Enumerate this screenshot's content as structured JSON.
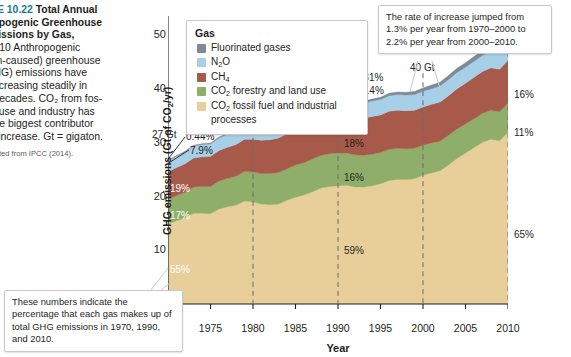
{
  "caption": {
    "figure_number": "URE 10.22",
    "title_line1": "Total Annual",
    "title_line2": "hropogenic Greenhouse",
    "title_line3": "Emissions by Gas,",
    "title_line4": "–2010",
    "body": "Anthropogenic (human-caused) greenhouse gas (GHG) emissions have been increasing steadily in recent decades. CO2 from fossil fuel use and industry has been the biggest contributor to this increase. Gt = gigaton.",
    "body_lines": [
      "–2010   Anthropogenic",
      "man-caused) greenhouse",
      "(GHG) emissions have",
      "n increasing steadily in",
      "nt decades. CO₂ from fos-",
      "uel use and industry has",
      "n the biggest contributor",
      "his increase. Gt = gigaton."
    ],
    "source": "adapted from IPCC (2014)."
  },
  "legend": {
    "title": "Gas",
    "items": [
      {
        "label": "Fluorinated gases",
        "color": "#7e8a99"
      },
      {
        "label": "N₂O",
        "color": "#a8cfe8"
      },
      {
        "label": "CH₄",
        "color": "#a85a4a"
      },
      {
        "label": "CO₂ forestry and land use",
        "color": "#8fae6a"
      },
      {
        "label": "CO₂ fossil fuel and industrial processes",
        "color": "#e8cf9a"
      }
    ]
  },
  "callouts": {
    "rate": "The rate of increase jumped from 1.3% per year from 1970–2000 to 2.2% per year from 2000–2010.",
    "percent": "These numbers indicate the percentage that each gas makes up of total GHG emissions in 1970, 1990, and 2010."
  },
  "annotations": {
    "gt_1970": "27 Gt",
    "gt_1980": "33 Gt",
    "gt_1990": "38 Gt",
    "gt_2000": "40 Gt",
    "gt_2010": "49 Gt",
    "pct_1970": {
      "f_gases": "0.44%",
      "n2o": "7.9%",
      "ch4": "19%",
      "co2_land": "17%",
      "co2_fossil": "55%"
    },
    "pct_1990": {
      "f_gases": "0.81%",
      "n2o": "7.4%",
      "ch4": "18%",
      "co2_land": "16%",
      "co2_fossil": "59%"
    },
    "pct_2010": {
      "f_gases": "2.0%",
      "n2o": "6.2%",
      "ch4": "16%",
      "co2_land": "11%",
      "co2_fossil": "65%"
    }
  },
  "chart_data": {
    "type": "area",
    "xlabel": "Year",
    "ylabel": "GHG emissions (Gt of CO₂/yr)",
    "xlim": [
      1970,
      2010
    ],
    "ylim": [
      -2,
      54
    ],
    "yticks": [
      -2,
      10,
      20,
      30,
      40,
      50
    ],
    "ytick_labels": [
      "–2",
      "10",
      "20",
      "30",
      "40",
      "50"
    ],
    "xticks": [
      1970,
      1975,
      1980,
      1985,
      1990,
      1995,
      2000,
      2005,
      2010
    ],
    "grid": false,
    "legend_position": "top-left-inside",
    "stacked": true,
    "x": [
      1970,
      1971,
      1972,
      1973,
      1974,
      1975,
      1976,
      1977,
      1978,
      1979,
      1980,
      1981,
      1982,
      1983,
      1984,
      1985,
      1986,
      1987,
      1988,
      1989,
      1990,
      1991,
      1992,
      1993,
      1994,
      1995,
      1996,
      1997,
      1998,
      1999,
      2000,
      2001,
      2002,
      2003,
      2004,
      2005,
      2006,
      2007,
      2008,
      2009,
      2010
    ],
    "series": [
      {
        "name": "CO₂ fossil fuel and industrial processes",
        "color": "#e8cf9a",
        "values": [
          14.9,
          15.5,
          16.0,
          16.9,
          16.9,
          16.8,
          17.7,
          18.1,
          18.4,
          19.2,
          19.0,
          18.6,
          18.5,
          18.6,
          19.3,
          19.9,
          20.3,
          20.9,
          21.6,
          21.9,
          22.0,
          22.1,
          21.8,
          21.8,
          22.0,
          22.4,
          23.0,
          23.2,
          23.2,
          23.3,
          24.0,
          24.4,
          24.8,
          25.9,
          27.1,
          28.1,
          29.1,
          30.1,
          30.7,
          30.4,
          32.0
        ]
      },
      {
        "name": "CO₂ forestry and land use",
        "color": "#8fae6a",
        "values": [
          4.6,
          4.7,
          4.8,
          4.9,
          5.0,
          5.1,
          5.2,
          5.3,
          5.4,
          5.5,
          5.6,
          5.7,
          5.8,
          5.9,
          5.9,
          6.0,
          6.0,
          6.1,
          6.1,
          6.1,
          6.1,
          6.0,
          6.0,
          5.9,
          5.9,
          5.8,
          5.8,
          5.8,
          5.7,
          5.7,
          5.6,
          5.6,
          5.5,
          5.5,
          5.5,
          5.4,
          5.4,
          5.4,
          5.4,
          5.4,
          5.4
        ]
      },
      {
        "name": "CH₄",
        "color": "#a85a4a",
        "values": [
          5.1,
          5.2,
          5.3,
          5.4,
          5.5,
          5.6,
          5.7,
          5.8,
          5.9,
          6.0,
          6.1,
          6.2,
          6.3,
          6.4,
          6.5,
          6.6,
          6.7,
          6.8,
          6.9,
          6.9,
          6.9,
          6.9,
          6.9,
          6.9,
          7.0,
          7.0,
          7.1,
          7.1,
          7.1,
          7.1,
          7.1,
          7.2,
          7.3,
          7.4,
          7.5,
          7.6,
          7.7,
          7.8,
          7.9,
          7.9,
          8.0
        ]
      },
      {
        "name": "N₂O",
        "color": "#a8cfe8",
        "values": [
          2.1,
          2.1,
          2.2,
          2.2,
          2.3,
          2.3,
          2.3,
          2.4,
          2.4,
          2.5,
          2.5,
          2.5,
          2.6,
          2.6,
          2.6,
          2.7,
          2.7,
          2.7,
          2.8,
          2.8,
          2.8,
          2.8,
          2.8,
          2.8,
          2.9,
          2.9,
          2.9,
          2.9,
          2.9,
          2.9,
          2.9,
          2.9,
          3.0,
          3.0,
          3.0,
          3.0,
          3.0,
          3.0,
          3.0,
          3.0,
          3.1
        ]
      },
      {
        "name": "Fluorinated gases",
        "color": "#7e8a99",
        "values": [
          0.12,
          0.13,
          0.14,
          0.15,
          0.16,
          0.17,
          0.18,
          0.19,
          0.2,
          0.21,
          0.22,
          0.24,
          0.25,
          0.26,
          0.28,
          0.29,
          0.31,
          0.33,
          0.35,
          0.36,
          0.31,
          0.32,
          0.33,
          0.34,
          0.36,
          0.4,
          0.44,
          0.48,
          0.53,
          0.58,
          0.63,
          0.66,
          0.7,
          0.74,
          0.79,
          0.83,
          0.87,
          0.9,
          0.94,
          0.96,
          1.0
        ]
      }
    ],
    "totals": {
      "1970": 27,
      "1980": 33,
      "1990": 38,
      "2000": 40,
      "2010": 49
    }
  }
}
